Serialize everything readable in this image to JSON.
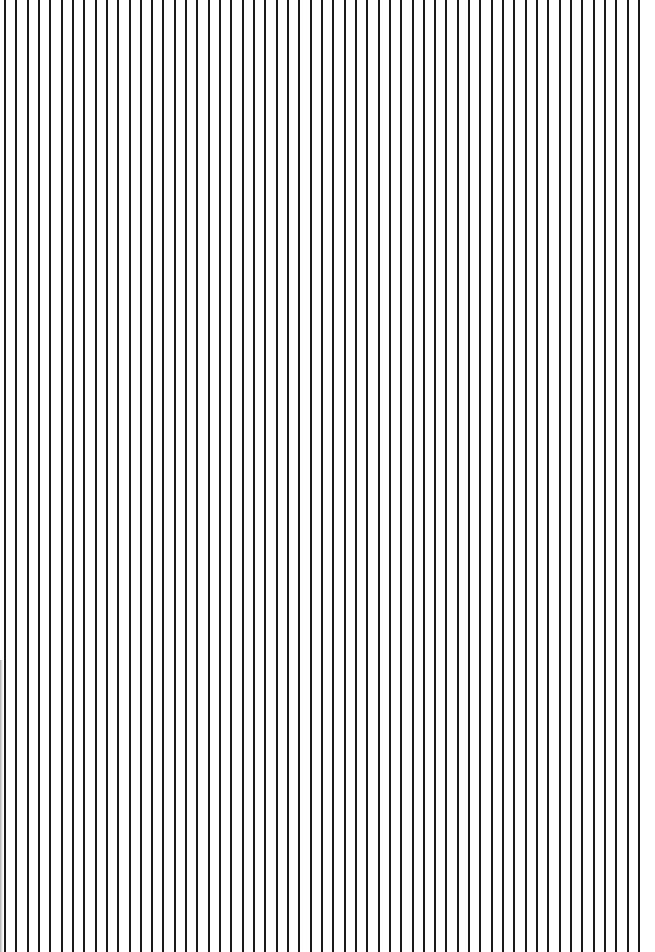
{
  "pattern": {
    "type": "vertical-stripes",
    "line_count": 57,
    "first_line_x": 4,
    "spacing_px": 11.32,
    "line_width_px": 2,
    "line_color": "#1a1a1a",
    "background_color": "#ffffff"
  }
}
